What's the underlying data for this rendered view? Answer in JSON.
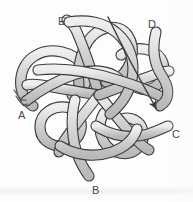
{
  "figure": {
    "background_color": "#fdfdfd",
    "strand_fill": "#c9c9c9",
    "strand_highlight": "#efefef",
    "strand_outline": "#3a3a3a",
    "label_color": "#4a4a4a",
    "strand_width_px": 9,
    "outline_width_px": 1.1
  },
  "labels": [
    {
      "id": "A",
      "text": "A",
      "x": 18,
      "y": 110
    },
    {
      "id": "B",
      "text": "B",
      "x": 92,
      "y": 185
    },
    {
      "id": "C",
      "text": "C",
      "x": 172,
      "y": 129
    },
    {
      "id": "D",
      "text": "D",
      "x": 148,
      "y": 19
    },
    {
      "id": "E",
      "text": "E",
      "x": 58,
      "y": 16
    }
  ],
  "annotations": [
    {
      "id": "flow-arrow",
      "type": "arrow",
      "description": "long thin arrow from upper-right strand D sweeping down toward lower right",
      "from_x": 108,
      "from_y": 17,
      "to_x": 160,
      "to_y": 113,
      "color": "#3a3a3a"
    }
  ],
  "strands": [
    {
      "id": "strand-a",
      "endpoint_label": "A",
      "description": "enters lower left, loops through center"
    },
    {
      "id": "strand-b",
      "endpoint_label": "B",
      "description": "exits bottom center"
    },
    {
      "id": "strand-c",
      "endpoint_label": "C",
      "description": "exits lower right"
    },
    {
      "id": "strand-d",
      "endpoint_label": "D",
      "description": "enters upper right"
    },
    {
      "id": "strand-e",
      "endpoint_label": "E",
      "description": "enters upper left"
    }
  ]
}
